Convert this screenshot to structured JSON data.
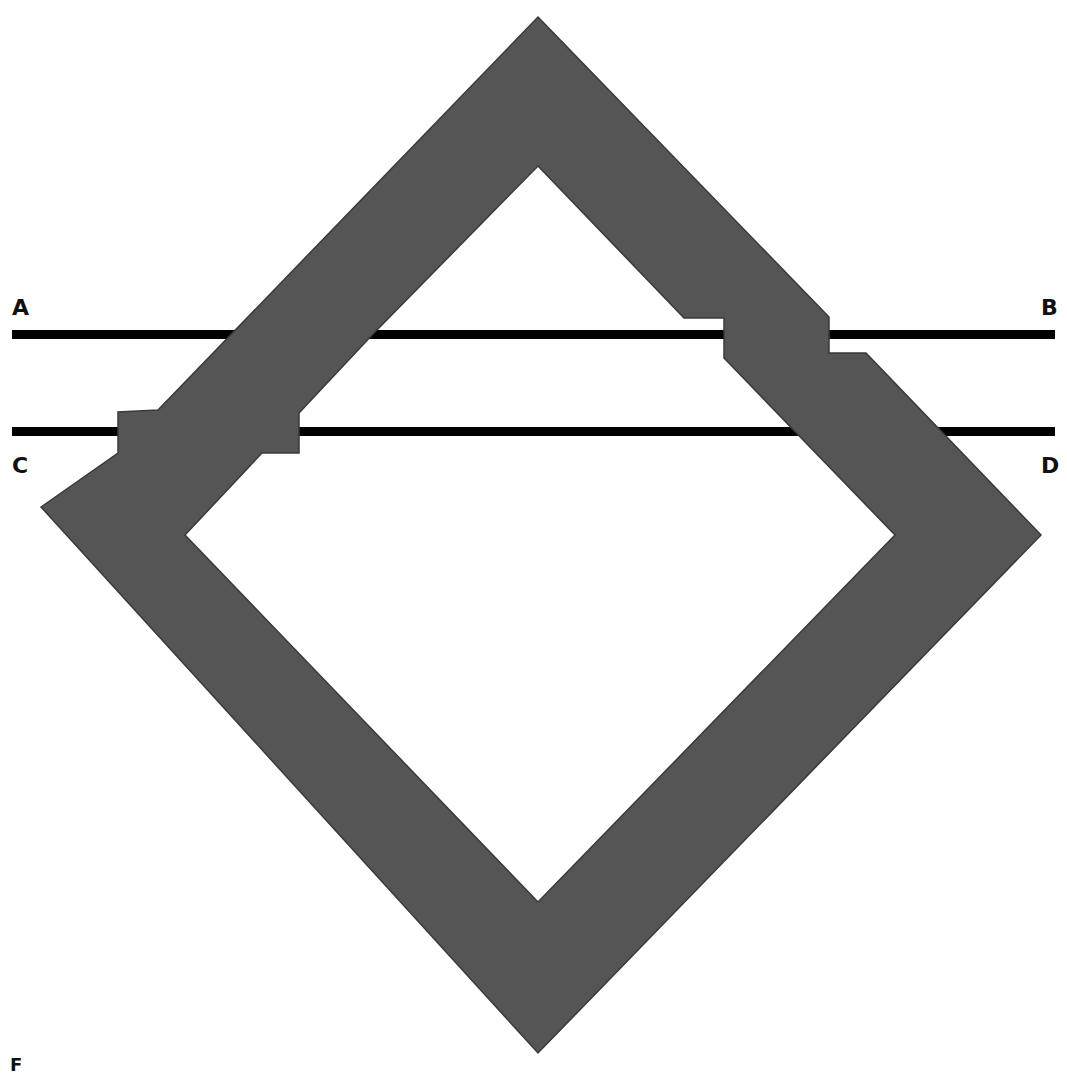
{
  "diagram": {
    "type": "fault-offset diagram",
    "shape_fill": "#555555",
    "shape_stroke": "#3a3a3a",
    "line_color": "#000000",
    "background": "#ffffff",
    "lines": [
      {
        "id": "AB",
        "start_label": "A",
        "end_label": "B"
      },
      {
        "id": "CD",
        "start_label": "C",
        "end_label": "D"
      }
    ],
    "labels": {
      "a": "A",
      "b": "B",
      "c": "C",
      "d": "D"
    },
    "caption": "F"
  }
}
